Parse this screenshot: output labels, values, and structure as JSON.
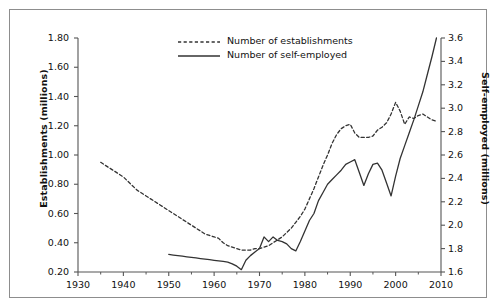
{
  "figure": {
    "caption_fragment": "",
    "background_color": "#ffffff",
    "frame_color": "#8d8d8d"
  },
  "chart_data": {
    "type": "line",
    "title": "",
    "xlabel": "",
    "ylabel": "Establishments (millions)",
    "y2label": "Self-employed (millions)",
    "grid": false,
    "legend_position": "top-center",
    "xlim": [
      1930,
      2010
    ],
    "ylim": [
      0.2,
      1.8
    ],
    "y2lim": [
      1.6,
      3.6
    ],
    "xticks": [
      1930,
      1940,
      1950,
      1960,
      1970,
      1980,
      1990,
      2000,
      2010
    ],
    "xtick_labels": [
      "1930",
      "1940",
      "1950",
      "1960",
      "1970",
      "1980",
      "1990",
      "2000",
      "2010"
    ],
    "yticks": [
      0.2,
      0.4,
      0.6,
      0.8,
      1.0,
      1.2,
      1.4,
      1.6,
      1.8
    ],
    "ytick_labels": [
      "0.20",
      "0.40",
      "0.60",
      "0.80",
      "1.00",
      "1.20",
      "1.40",
      "1.60",
      "1.80"
    ],
    "y2ticks": [
      1.6,
      1.8,
      2.0,
      2.2,
      2.4,
      2.6,
      2.8,
      3.0,
      3.2,
      3.4,
      3.6
    ],
    "y2tick_labels": [
      "1.6",
      "1.8",
      "2.0",
      "2.2",
      "2.4",
      "2.6",
      "2.8",
      "3.0",
      "3.2",
      "3.4",
      "3.6"
    ],
    "series": [
      {
        "name": "Number of establishments",
        "axis": "left",
        "style": "dashed",
        "color": "#333333",
        "x": [
          1935,
          1936,
          1937,
          1938,
          1939,
          1940,
          1941,
          1942,
          1943,
          1944,
          1945,
          1946,
          1947,
          1948,
          1949,
          1950,
          1951,
          1952,
          1953,
          1954,
          1955,
          1956,
          1957,
          1958,
          1959,
          1960,
          1961,
          1962,
          1963,
          1964,
          1965,
          1966,
          1967,
          1968,
          1969,
          1970,
          1971,
          1972,
          1973,
          1974,
          1975,
          1976,
          1977,
          1978,
          1979,
          1980,
          1981,
          1982,
          1983,
          1984,
          1985,
          1986,
          1987,
          1988,
          1989,
          1990,
          1991,
          1992,
          1993,
          1994,
          1995,
          1996,
          1997,
          1998,
          1999,
          2000,
          2001,
          2002,
          2003,
          2004,
          2005,
          2006,
          2007,
          2008,
          2009
        ],
        "y": [
          0.95,
          0.93,
          0.91,
          0.89,
          0.87,
          0.85,
          0.82,
          0.79,
          0.76,
          0.74,
          0.72,
          0.7,
          0.68,
          0.66,
          0.64,
          0.62,
          0.6,
          0.58,
          0.56,
          0.54,
          0.52,
          0.5,
          0.48,
          0.46,
          0.45,
          0.44,
          0.43,
          0.4,
          0.38,
          0.37,
          0.36,
          0.35,
          0.35,
          0.35,
          0.36,
          0.36,
          0.37,
          0.38,
          0.4,
          0.42,
          0.44,
          0.47,
          0.5,
          0.54,
          0.58,
          0.63,
          0.7,
          0.77,
          0.85,
          0.93,
          1.0,
          1.08,
          1.14,
          1.18,
          1.2,
          1.21,
          1.15,
          1.12,
          1.12,
          1.12,
          1.13,
          1.17,
          1.19,
          1.22,
          1.28,
          1.36,
          1.3,
          1.21,
          1.26,
          1.25,
          1.27,
          1.28,
          1.26,
          1.24,
          1.23
        ]
      },
      {
        "name": "Number of self-employed",
        "axis": "right",
        "style": "solid",
        "color": "#333333",
        "x": [
          1950,
          1951,
          1952,
          1953,
          1954,
          1955,
          1956,
          1957,
          1958,
          1959,
          1960,
          1961,
          1962,
          1963,
          1964,
          1965,
          1966,
          1967,
          1968,
          1969,
          1970,
          1971,
          1972,
          1973,
          1974,
          1975,
          1976,
          1977,
          1978,
          1979,
          1980,
          1981,
          1982,
          1983,
          1984,
          1985,
          1986,
          1987,
          1988,
          1989,
          1990,
          1991,
          1992,
          1993,
          1994,
          1995,
          1996,
          1997,
          1998,
          1999,
          2000,
          2001,
          2002,
          2003,
          2004,
          2005,
          2006,
          2007,
          2008,
          2009
        ],
        "y": [
          1.75,
          1.745,
          1.74,
          1.735,
          1.73,
          1.725,
          1.72,
          1.715,
          1.71,
          1.705,
          1.7,
          1.695,
          1.69,
          1.685,
          1.67,
          1.65,
          1.62,
          1.7,
          1.74,
          1.77,
          1.8,
          1.9,
          1.86,
          1.9,
          1.87,
          1.86,
          1.84,
          1.8,
          1.78,
          1.86,
          1.95,
          2.04,
          2.1,
          2.21,
          2.28,
          2.35,
          2.39,
          2.43,
          2.47,
          2.52,
          2.54,
          2.56,
          2.45,
          2.34,
          2.44,
          2.52,
          2.53,
          2.47,
          2.36,
          2.25,
          2.42,
          2.57,
          2.68,
          2.79,
          2.9,
          3.02,
          3.14,
          3.29,
          3.44,
          3.6
        ]
      }
    ]
  },
  "legend": {
    "items": [
      {
        "label": "Number of establishments",
        "style": "dashed"
      },
      {
        "label": "Number of self-employed",
        "style": "solid"
      }
    ]
  }
}
